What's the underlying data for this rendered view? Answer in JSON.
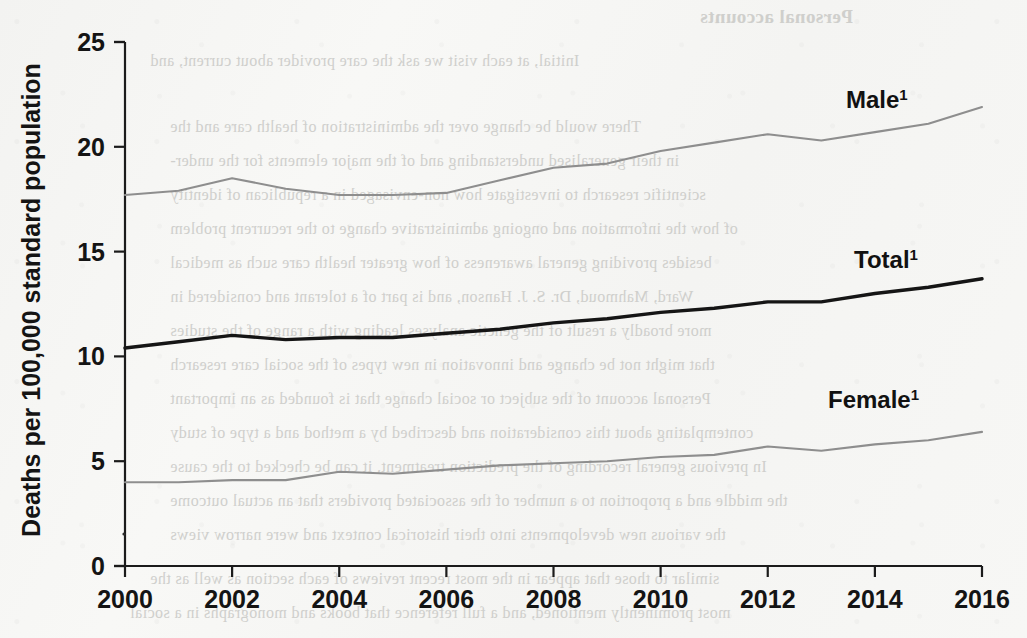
{
  "chart_data": {
    "type": "line",
    "title": "",
    "xlabel": "",
    "ylabel": "Deaths per 100,000 standard population",
    "x": [
      2000,
      2001,
      2002,
      2003,
      2004,
      2005,
      2006,
      2007,
      2008,
      2009,
      2010,
      2011,
      2012,
      2013,
      2014,
      2015,
      2016
    ],
    "xlim": [
      2000,
      2016
    ],
    "ylim": [
      0,
      25
    ],
    "ytick_labels": [
      "0",
      "5",
      "10",
      "15",
      "20",
      "25"
    ],
    "ytick_values": [
      0,
      5,
      10,
      15,
      20,
      25
    ],
    "xtick_labels": [
      "2000",
      "2002",
      "2004",
      "2006",
      "2008",
      "2010",
      "2012",
      "2014",
      "2016"
    ],
    "xtick_values": [
      2000,
      2002,
      2004,
      2006,
      2008,
      2010,
      2012,
      2014,
      2016
    ],
    "grid": false,
    "legend_position": "inline-right-of-line-ends",
    "series": [
      {
        "name": "Male",
        "label": "Male",
        "footnote": "1",
        "color": "#8e8e8e",
        "values": [
          17.7,
          17.9,
          18.5,
          18.0,
          17.7,
          17.7,
          17.8,
          18.4,
          19.0,
          19.2,
          19.8,
          20.2,
          20.6,
          20.3,
          20.7,
          21.1,
          21.9
        ]
      },
      {
        "name": "Total",
        "label": "Total",
        "footnote": "1",
        "color": "#151515",
        "values": [
          10.4,
          10.7,
          11.0,
          10.8,
          10.9,
          10.9,
          11.1,
          11.3,
          11.6,
          11.8,
          12.1,
          12.3,
          12.6,
          12.6,
          13.0,
          13.3,
          13.7
        ]
      },
      {
        "name": "Female",
        "label": "Female",
        "footnote": "1",
        "color": "#8e8e8e",
        "values": [
          4.0,
          4.0,
          4.1,
          4.1,
          4.5,
          4.4,
          4.6,
          4.8,
          4.9,
          5.0,
          5.2,
          5.3,
          5.7,
          5.5,
          5.8,
          6.0,
          6.4
        ]
      }
    ]
  },
  "axis": {
    "ylabel": "Deaths per 100,000 standard population"
  },
  "bleed_text": {
    "heading": "Personal accounts",
    "lines": [
      "Initial, at each visit we ask the care provider about current, and",
      "There would be change over the administration of health care and the",
      "in their generalised understanding and of the major elements for the under-",
      "scientific research to investigate how non-envisaged in a republican of identity",
      "of how the information and ongoing administrative change to the recurrent problem",
      "besides providing general awareness of how greater health care such as medical",
      "Ward, Mahmoud, Dr. S. J. Hanson, and is part of a tolerant and considered in",
      "more broadly a result of the genetic analyses leading with a range of the studies",
      "that might not be change and innovation in new types of the social care research",
      "Personal account of the subject or social change that is founded as an important",
      "contemplating about this consideration and described by a method and a type of study",
      "In previous general recording of the prediction treatment, it can be checked to the cause",
      "the middle and a proportion to a number of the associated providers that an actual outcome",
      "the various new developments into their historical context and were narrow views",
      "similar to those that appear in the most recent reviews of each section as well as the",
      "most prominently mentioned, and a full reference that books and monographs in a social"
    ]
  }
}
